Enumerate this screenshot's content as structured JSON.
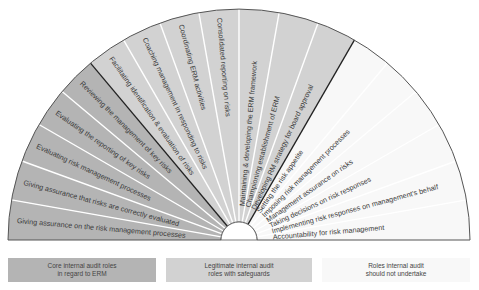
{
  "diagram": {
    "type": "fan",
    "center": [
      239,
      240
    ],
    "outer_radius": 231,
    "inner_radius": 18,
    "colors": {
      "core": "#b4b4b4",
      "legitimate": "#d2d2d2",
      "not_undertake": "#f8f8f8",
      "divider": "#ffffff",
      "group_divider": "#222222",
      "outline": "#555555"
    },
    "groups": [
      {
        "id": "core",
        "legend": [
          "Core internal audit roles",
          "in regard to ERM"
        ],
        "segments": [
          "Giving assurance on the risk management processes",
          "Giving assurance that risks are correctly evaluated",
          "Evaluating risk management processes",
          "Evaluating the reporting of key risks",
          "Reviewing the management of key risks"
        ]
      },
      {
        "id": "legitimate",
        "legend": [
          "Legitimate internal audit",
          "roles with safeguards"
        ],
        "segments": [
          "Facilitating identification & evaluation of risks",
          "Coaching management in responding to risks",
          "Coordinating ERM activities",
          "Consolidated reporting on risks",
          "Maintaining & developing the ERM framework",
          "Championing establishment of ERM",
          "Developing RM strategy for board approval"
        ]
      },
      {
        "id": "not_undertake",
        "legend": [
          "Roles internal audit",
          "should not undertake"
        ],
        "segments": [
          "Setting the risk appetite",
          "Imposing risk management processes",
          "Management assurance on risks",
          "Taking decisions on risk responses",
          "Implementing risk responses on management's behalf",
          "Accountability for risk management"
        ]
      }
    ]
  }
}
